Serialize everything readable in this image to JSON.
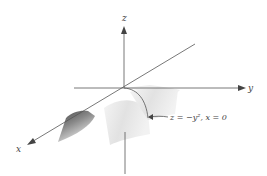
{
  "diagram": {
    "type": "3d-surface-plot",
    "axes": {
      "z_label": "z",
      "y_label": "y",
      "x_label": "x"
    },
    "annotation": "z = −y², x = 0",
    "colors": {
      "axis": "#555555",
      "surface_light": "#eeeeee",
      "surface_dark": "#555555",
      "text": "#444444"
    }
  }
}
